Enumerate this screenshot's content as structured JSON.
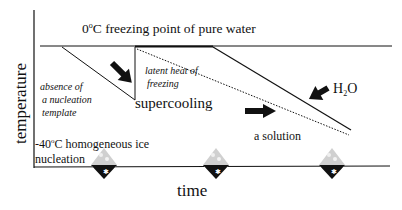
{
  "diagram": {
    "axes": {
      "y_label": "temperature",
      "x_label": "time"
    },
    "top_line_label": {
      "value": "0",
      "unit_sup": "o",
      "rest": "C freezing point of pure water"
    },
    "annotations": {
      "absence": [
        "absence of",
        "a nucleation",
        "template"
      ],
      "latent_heat": [
        "latent heat of",
        "freezing"
      ],
      "supercooling": "supercooling",
      "homogeneous": {
        "prefix": "-40",
        "sup": "o",
        "rest": "C homogeneous ice nucleation"
      },
      "solution": "a solution",
      "h2o": {
        "h": "H",
        "sub": "2",
        "o": "O"
      }
    },
    "markers": [
      {
        "name": "ice-crystal-diamond",
        "x": 104
      },
      {
        "name": "ice-crystal-diamond",
        "x": 216
      },
      {
        "name": "ice-crystal-diamond",
        "x": 332
      }
    ],
    "colors": {
      "line": "#111111",
      "diamond_light": "#c8c8c8",
      "diamond_dark": "#111111"
    }
  }
}
